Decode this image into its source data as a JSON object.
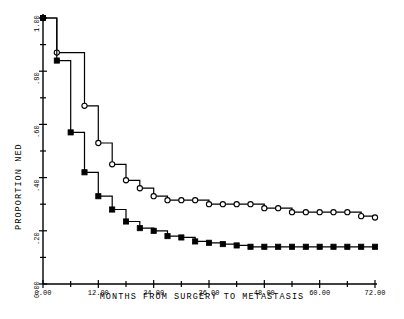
{
  "chart_data": {
    "type": "line",
    "title": "",
    "xlabel": "MONTHS FROM SURGERY TO METASTASIS",
    "ylabel": "PROPORTION NED",
    "xlim": [
      0,
      72
    ],
    "ylim": [
      0,
      1.0
    ],
    "grid": false,
    "legend_position": "none",
    "xticks": [
      0,
      12,
      24,
      36,
      48,
      60,
      72
    ],
    "xticklabels": [
      "0.00",
      "12.00",
      "24.00",
      "36.00",
      "48.00",
      "60.00",
      "72.00"
    ],
    "yticks": [
      0.0,
      0.2,
      0.4,
      0.6,
      0.8,
      1.0
    ],
    "yticklabels": [
      "0.00",
      ".20",
      ".40",
      ".60",
      ".80",
      "1.00"
    ],
    "minor_ytick_step": 0.1,
    "minor_xtick_step": 6,
    "line_color": "#000000",
    "series": [
      {
        "name": "open-circle-curve",
        "marker": "open-circle",
        "step": "post",
        "x": [
          0,
          3,
          9,
          12,
          15,
          18,
          21,
          24,
          27,
          30,
          33,
          36,
          39,
          42,
          45,
          48,
          51,
          54,
          57,
          60,
          63,
          66,
          69,
          72
        ],
        "y": [
          1.0,
          0.87,
          0.67,
          0.53,
          0.45,
          0.39,
          0.36,
          0.33,
          0.315,
          0.315,
          0.315,
          0.3,
          0.3,
          0.3,
          0.3,
          0.285,
          0.285,
          0.27,
          0.27,
          0.27,
          0.27,
          0.27,
          0.255,
          0.25
        ]
      },
      {
        "name": "filled-square-curve",
        "marker": "filled-square",
        "step": "post",
        "x": [
          0,
          3,
          6,
          9,
          12,
          15,
          18,
          21,
          24,
          27,
          30,
          33,
          36,
          39,
          42,
          45,
          48,
          51,
          54,
          57,
          60,
          63,
          66,
          69,
          72
        ],
        "y": [
          1.0,
          0.84,
          0.57,
          0.42,
          0.33,
          0.28,
          0.235,
          0.21,
          0.2,
          0.18,
          0.175,
          0.16,
          0.155,
          0.15,
          0.145,
          0.14,
          0.14,
          0.14,
          0.14,
          0.14,
          0.14,
          0.14,
          0.14,
          0.14,
          0.14
        ]
      }
    ]
  }
}
